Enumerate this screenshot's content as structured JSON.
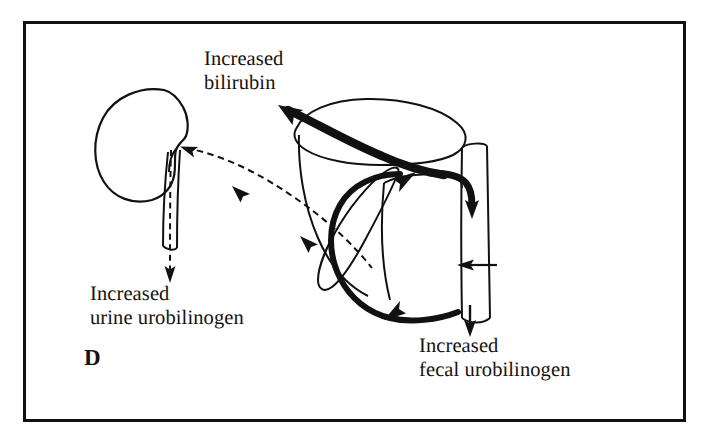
{
  "figure": {
    "panel_letter": "D",
    "frame_color": "#111111",
    "ink_color": "#111111",
    "background_color": "#ffffff",
    "canvas": {
      "width": 708,
      "height": 447
    }
  },
  "labels": {
    "bilirubin": {
      "line1": "Increased",
      "line2": "bilirubin"
    },
    "urine_urobilinogen": {
      "line1": "Increased",
      "line2": "urine urobilinogen"
    },
    "fecal_urobilinogen": {
      "line1": "Increased",
      "line2": "fecal urobilinogen"
    },
    "gut_urobilinogen": {
      "line1": "Increased",
      "line2": "urobilinogen"
    }
  },
  "organs": {
    "kidney": "kidney-outline",
    "ureter": "ureter-tube",
    "liver": "liver-outline",
    "gallbladder": "gallbladder-outline",
    "bile_duct": "bile-duct",
    "intestine": "intestine-tube"
  },
  "flows": {
    "bilirubin_to_liver": {
      "style": "thick-solid",
      "direction": "to-liver"
    },
    "bile_to_intestine": {
      "style": "thick-solid",
      "direction": "down-into-intestine"
    },
    "enterohepatic_recirculation": {
      "style": "thick-solid",
      "direction": "gut-to-liver"
    },
    "gut_to_kidney": {
      "style": "dashed",
      "direction": "to-kidney"
    },
    "urine_excretion": {
      "style": "dashed",
      "direction": "down-out-of-ureter"
    },
    "fecal_excretion": {
      "style": "solid",
      "direction": "down-out-of-intestine"
    },
    "gut_urobilinogen_pointer": {
      "style": "solid-leader",
      "direction": "left-into-intestine"
    }
  }
}
